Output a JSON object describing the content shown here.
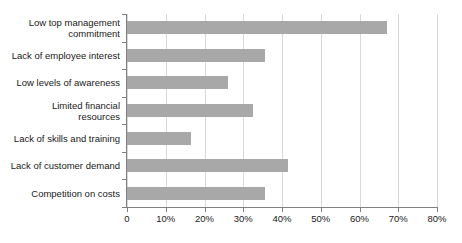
{
  "chart_data": {
    "type": "bar",
    "orientation": "horizontal",
    "title": "",
    "subtitle": "",
    "xlabel": "",
    "ylabel": "",
    "xlim": [
      0,
      80
    ],
    "xtick_step": 10,
    "grid": "vertical",
    "legend": "none",
    "categories": [
      "Low top management\ncommitment",
      "Lack of employee interest",
      "Low levels of awareness",
      "Limited financial\nresources",
      "Lack of skills and training",
      "Lack of customer demand",
      "Competition on costs"
    ],
    "values": [
      67,
      35.5,
      26,
      32.5,
      16.5,
      41.5,
      35.5
    ],
    "value_unit": "%",
    "xtick_labels": [
      "0",
      "10%",
      "20%",
      "30%",
      "40%",
      "50%",
      "60%",
      "70%",
      "80%"
    ],
    "xtick_values": [
      0,
      10,
      20,
      30,
      40,
      50,
      60,
      70,
      80
    ],
    "colors": {
      "bar": "#a8a8a8",
      "gridline": "#d9d9d9",
      "axis": "#808080",
      "text": "#1a1a1a",
      "background": "#ffffff"
    }
  }
}
